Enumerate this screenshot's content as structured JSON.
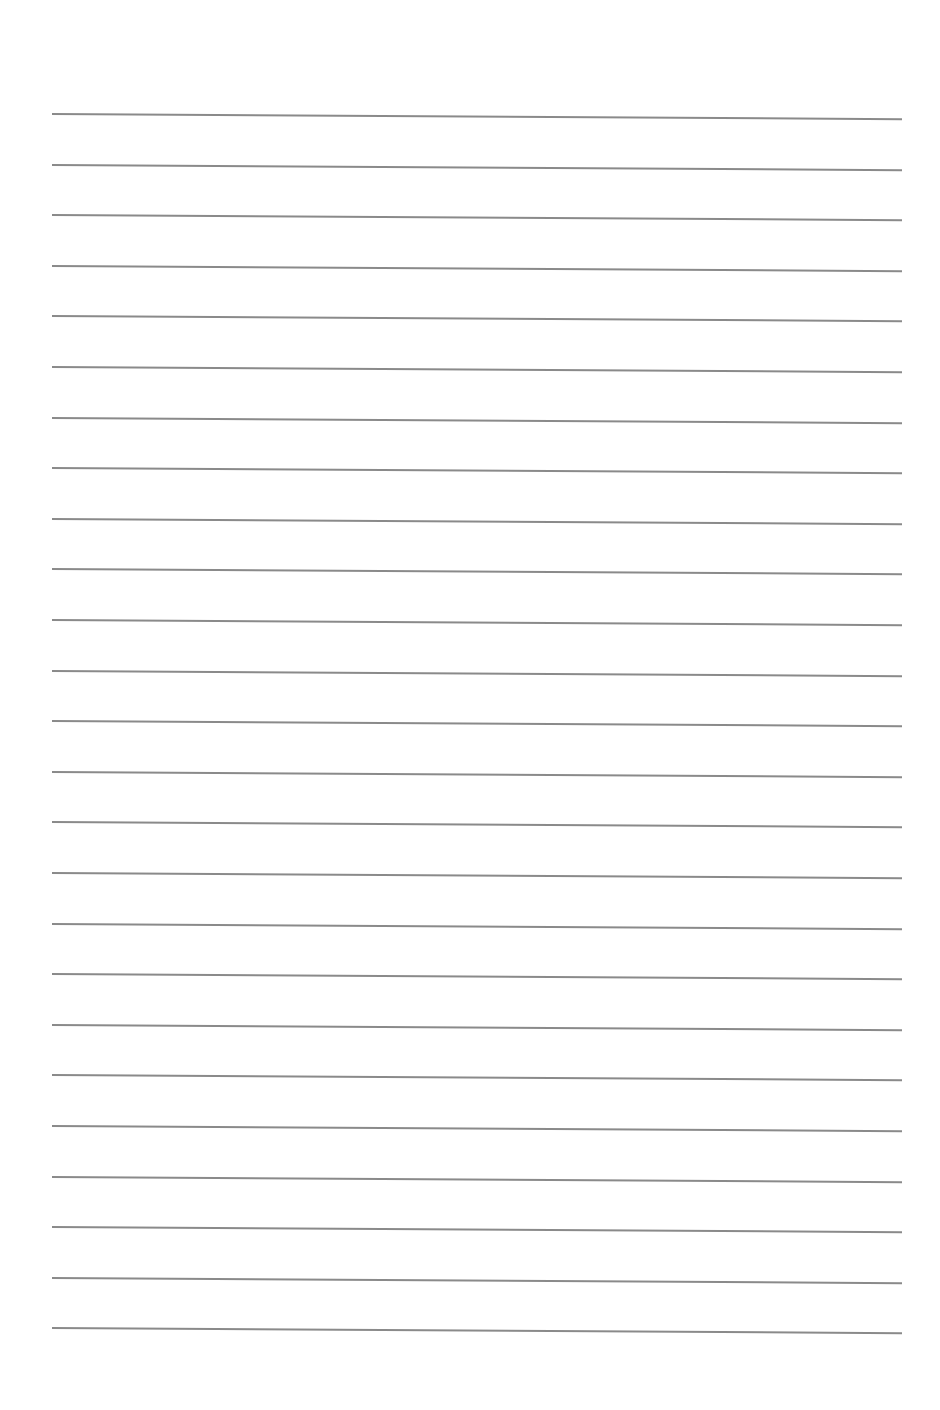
{
  "page": {
    "type": "blank lined paper",
    "background_color": "#ffffff",
    "line_color": "#8a8a8a",
    "line_count": 25,
    "first_line_y": 113,
    "line_spacing": 50.6,
    "line_left_x": 52,
    "line_right_x": 902
  }
}
